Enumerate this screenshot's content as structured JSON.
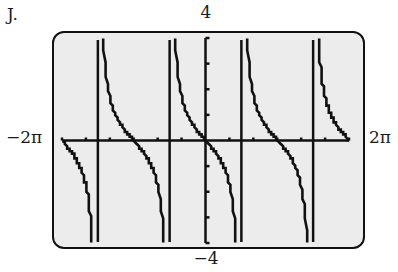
{
  "labels": {
    "problem": "J.",
    "ymax": "4",
    "ymin": "−4",
    "xmin": "−2π",
    "xmax": "2π"
  },
  "chart_data": {
    "type": "line",
    "title": "",
    "function": "y = -tan(x)",
    "xlabel": "",
    "ylabel": "",
    "xlim": [
      -6.2832,
      6.2832
    ],
    "ylim": [
      -4,
      4
    ],
    "x_tick_labels": [
      "-2π",
      "2π"
    ],
    "y_tick_labels": [
      "-4",
      "4"
    ],
    "x_ticks_count_each_side": 6,
    "y_ticks_count_each_side": 4,
    "grid": false,
    "legend": null,
    "vertical_asymptotes": [
      -4.7124,
      -1.5708,
      1.5708,
      4.7124
    ],
    "x_intercepts": [
      -6.2832,
      -3.1416,
      0,
      3.1416,
      6.2832
    ],
    "series": [
      {
        "name": "y = -tan(x)",
        "sample_points": [
          {
            "x": -6.2832,
            "y": 0
          },
          {
            "x": -5.5,
            "y": -0.9956
          },
          {
            "x": -5.0,
            "y": -3.3805
          },
          {
            "x": -4.3,
            "y": 2.2
          },
          {
            "x": -3.6,
            "y": 0.4935
          },
          {
            "x": -3.1416,
            "y": 0
          },
          {
            "x": -2.6,
            "y": -0.6016
          },
          {
            "x": -2.0,
            "y": -2.185
          },
          {
            "x": -1.2,
            "y": 2.572
          },
          {
            "x": -0.6,
            "y": 0.6841
          },
          {
            "x": 0,
            "y": 0
          },
          {
            "x": 0.6,
            "y": -0.6841
          },
          {
            "x": 1.2,
            "y": -2.572
          },
          {
            "x": 2.0,
            "y": 2.185
          },
          {
            "x": 2.6,
            "y": 0.6016
          },
          {
            "x": 3.1416,
            "y": 0
          },
          {
            "x": 3.6,
            "y": -0.4935
          },
          {
            "x": 4.3,
            "y": -2.2
          },
          {
            "x": 5.0,
            "y": 3.3805
          },
          {
            "x": 5.5,
            "y": 0.9956
          },
          {
            "x": 6.2832,
            "y": 0
          }
        ]
      }
    ]
  }
}
